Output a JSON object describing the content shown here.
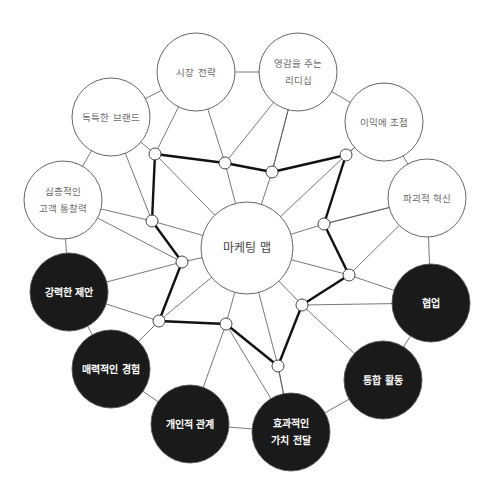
{
  "title": "마케팅 맵",
  "colors": {
    "background": "#ffffff",
    "outline": "#555555",
    "dark_fill": "#1a1a1a",
    "thick_line": "#111111",
    "light_text": "#6a6a6a",
    "dark_text": "#ffffff"
  },
  "center_node": {
    "label": "마케팅 맵",
    "x": 247,
    "y": 248,
    "r": 46
  },
  "outer_nodes": [
    {
      "id": "market-strategy",
      "lines": [
        "시장 전략"
      ],
      "x": 196,
      "y": 72,
      "style": "light"
    },
    {
      "id": "inspiring-leadership",
      "lines": [
        "영감을 주는",
        "리디십"
      ],
      "x": 298,
      "y": 72,
      "style": "light"
    },
    {
      "id": "profit-focus",
      "lines": [
        "이익에 초점"
      ],
      "x": 384,
      "y": 122,
      "style": "light"
    },
    {
      "id": "disruptive-innovation",
      "lines": [
        "파괴적 혁신"
      ],
      "x": 427,
      "y": 198,
      "style": "light"
    },
    {
      "id": "collaboration",
      "lines": [
        "협업"
      ],
      "x": 431,
      "y": 303,
      "style": "dark"
    },
    {
      "id": "integrated-activities",
      "lines": [
        "통합 활동"
      ],
      "x": 383,
      "y": 380,
      "style": "dark"
    },
    {
      "id": "effective-value-delivery",
      "lines": [
        "효과적인",
        "가치 전달"
      ],
      "x": 291,
      "y": 432,
      "style": "dark"
    },
    {
      "id": "personal-relationships",
      "lines": [
        "개인적 관계"
      ],
      "x": 190,
      "y": 424,
      "style": "dark"
    },
    {
      "id": "engaging-experience",
      "lines": [
        "매력적인 경험"
      ],
      "x": 111,
      "y": 369,
      "style": "dark"
    },
    {
      "id": "strong-proposition",
      "lines": [
        "강력한 제안"
      ],
      "x": 69,
      "y": 292,
      "style": "dark"
    },
    {
      "id": "deep-customer-insight",
      "lines": [
        "심층적인",
        "고객 통찰력"
      ],
      "x": 63,
      "y": 200,
      "style": "light"
    },
    {
      "id": "unique-brand",
      "lines": [
        "독특한 브랜드"
      ],
      "x": 111,
      "y": 117,
      "style": "light"
    }
  ],
  "outer_radius": 39,
  "junctions": [
    {
      "x": 155,
      "y": 154
    },
    {
      "x": 225,
      "y": 163
    },
    {
      "x": 272,
      "y": 172
    },
    {
      "x": 346,
      "y": 155
    },
    {
      "x": 324,
      "y": 224
    },
    {
      "x": 349,
      "y": 275
    },
    {
      "x": 302,
      "y": 305
    },
    {
      "x": 278,
      "y": 366
    },
    {
      "x": 226,
      "y": 324
    },
    {
      "x": 159,
      "y": 321
    },
    {
      "x": 182,
      "y": 262
    },
    {
      "x": 152,
      "y": 221
    }
  ],
  "junction_radius": 6
}
